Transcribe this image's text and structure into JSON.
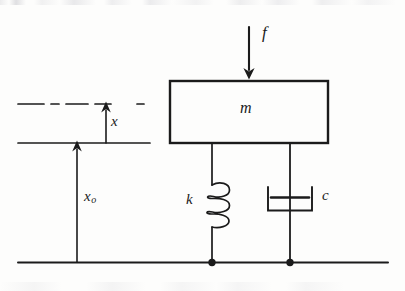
{
  "figure": {
    "kind": "mass-spring-damper-schematic",
    "ink_color": "#1b1b1b",
    "page_color": "#fdfdfc",
    "labels": {
      "force": "f",
      "mass": "m",
      "spring": "k",
      "damper": "c",
      "displacement": "x",
      "base_displacement": "x",
      "base_displacement_subscript": "o"
    },
    "elements": {
      "mass_block": {
        "name": "mass-block",
        "x": 170,
        "y": 81,
        "width": 158,
        "height": 62
      },
      "force_arrow": {
        "name": "force-arrow",
        "x": 249,
        "y_start": 27,
        "y_end": 78,
        "direction": "down"
      },
      "spring": {
        "name": "spring",
        "x": 212,
        "y_top": 143,
        "y_bottom": 262,
        "coil_top": 184,
        "coil_bottom": 221,
        "coils": 3
      },
      "damper": {
        "name": "damper",
        "x": 290,
        "y_top": 143,
        "y_bottom": 262,
        "cylinder_left": 268,
        "cylinder_right": 312,
        "cylinder_top": 187,
        "cylinder_bottom": 211,
        "piston_y": 197
      },
      "ground_line": {
        "name": "ground-line",
        "x_start": 18,
        "x_end": 388,
        "y": 262
      },
      "reference_line_solid": {
        "name": "reference-line-solid",
        "x_start": 18,
        "x_end": 150,
        "y": 143
      },
      "reference_line_dashed": {
        "name": "reference-line-dashed",
        "x_start": 18,
        "x_end": 150,
        "y": 104,
        "style": "dash-dot"
      },
      "displacement_arrow_x": {
        "name": "displacement-arrow-x",
        "x": 106,
        "y_start": 143,
        "y_end": 104,
        "direction": "up"
      },
      "displacement_arrow_x0": {
        "name": "displacement-arrow-x0",
        "x": 77,
        "y_start": 262,
        "y_end": 143,
        "direction": "up"
      },
      "joint_dots": [
        {
          "name": "joint-dot-spring",
          "x": 212,
          "y": 262,
          "r": 3.6
        },
        {
          "name": "joint-dot-damper",
          "x": 290,
          "y": 262,
          "r": 3.6
        }
      ]
    }
  }
}
